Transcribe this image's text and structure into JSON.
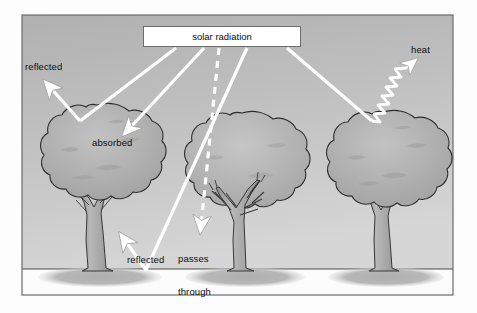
{
  "diagram": {
    "frame": {
      "x": 22,
      "y": 15,
      "width": 431,
      "height": 280,
      "border_color": "#6b6b6b",
      "sky_top_color": "#b9b9b9",
      "sky_bottom_color": "#d2d2d2",
      "ground_color": "#fbfbfb",
      "ground_line_y": 269,
      "shadow_color": "#b4b4b4"
    },
    "labels": {
      "solar_radiation": "solar radiation",
      "reflected_top": "reflected",
      "absorbed": "absorbed",
      "reflected_bottom": "reflected",
      "passes_line1": "passes",
      "passes_line2": "through",
      "heat": "heat"
    },
    "colors": {
      "ray": "#ffffff",
      "ray_outline": "#9a9a9a",
      "canopy_fill": "#adadad",
      "canopy_fill_light": "#bcbcbc",
      "canopy_outline": "#2e2e2e",
      "trunk_fill": "#a8a8a8",
      "trunk_outline": "#2e2e2e",
      "text": "#0d0d0d",
      "box_fill": "#ffffff",
      "box_border": "#6d6d6d"
    },
    "trees": [
      {
        "name": "left-tree",
        "canopy_cx": 97,
        "canopy_cy": 157,
        "canopy_rx": 63,
        "canopy_ry": 52,
        "trunk_x": 97,
        "trunk_top": 197,
        "trunk_bottom": 270,
        "shadow_cx": 100,
        "shadow_cy": 277,
        "shadow_rx": 62,
        "shadow_ry": 11,
        "dense": true
      },
      {
        "name": "middle-tree",
        "canopy_cx": 242,
        "canopy_cy": 163,
        "canopy_rx": 60,
        "canopy_ry": 50,
        "trunk_x": 242,
        "trunk_top": 200,
        "trunk_bottom": 270,
        "shadow_cx": 245,
        "shadow_cy": 277,
        "shadow_rx": 60,
        "shadow_ry": 11,
        "dense": false
      },
      {
        "name": "right-tree",
        "canopy_cx": 383,
        "canopy_cy": 163,
        "canopy_rx": 62,
        "canopy_ry": 51,
        "trunk_x": 383,
        "trunk_top": 202,
        "trunk_bottom": 270,
        "shadow_cx": 386,
        "shadow_cy": 277,
        "shadow_rx": 60,
        "shadow_ry": 11,
        "dense": true
      }
    ],
    "rays": [
      {
        "name": "ray-to-left-canopy-reflect",
        "from": [
          176,
          48
        ],
        "to": [
          79,
          122
        ],
        "arrow": false
      },
      {
        "name": "ray-reflected-up-left",
        "from": [
          79,
          122
        ],
        "to": [
          46,
          84
        ],
        "arrow": true
      },
      {
        "name": "ray-absorbed",
        "from": [
          204,
          48
        ],
        "to": [
          130,
          133
        ],
        "arrow": true
      },
      {
        "name": "ray-passes-through-dashed",
        "from": [
          219,
          48
        ],
        "to": [
          200,
          230
        ],
        "arrow": true,
        "dashed": true
      },
      {
        "name": "ray-to-ground",
        "from": [
          246,
          48
        ],
        "to": [
          146,
          271
        ],
        "arrow": false
      },
      {
        "name": "ray-reflected-up-from-ground",
        "from": [
          146,
          271
        ],
        "to": [
          122,
          236
        ],
        "arrow": true
      },
      {
        "name": "ray-to-right-canopy",
        "from": [
          286,
          48
        ],
        "to": [
          371,
          122
        ],
        "arrow": false
      },
      {
        "name": "ray-heat-wavy",
        "from": [
          371,
          122
        ],
        "to": [
          421,
          60
        ],
        "arrow": true,
        "wavy": true
      }
    ],
    "processes": [
      {
        "label": "reflected",
        "description": "radiation bouncing off canopy back to sky"
      },
      {
        "label": "absorbed",
        "description": "radiation taken in by dense canopy"
      },
      {
        "label": "passes through",
        "description": "radiation penetrating sparse canopy to ground"
      },
      {
        "label": "reflected",
        "description": "radiation bouncing off the ground surface"
      },
      {
        "label": "heat",
        "description": "re-radiated heat leaving canopy as wavy arrow"
      }
    ]
  }
}
